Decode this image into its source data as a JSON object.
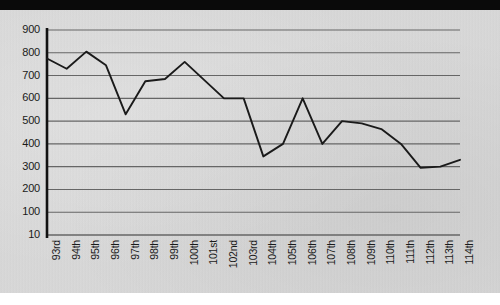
{
  "chart_data": {
    "type": "line",
    "title": "",
    "subtitle": "",
    "xlabel": "",
    "ylabel": "",
    "categories": [
      "93rd",
      "94th",
      "95th",
      "96th",
      "97th",
      "98th",
      "99th",
      "100th",
      "101st",
      "102nd",
      "103rd",
      "104th",
      "105th",
      "106th",
      "107th",
      "108th",
      "109th",
      "110th",
      "111th",
      "112th",
      "113th",
      "114th"
    ],
    "values": [
      775,
      730,
      805,
      745,
      530,
      675,
      685,
      760,
      680,
      600,
      600,
      345,
      400,
      600,
      400,
      500,
      490,
      465,
      400,
      295,
      300,
      330
    ],
    "series": [
      {
        "name": "",
        "values": [
          775,
          730,
          805,
          745,
          530,
          675,
          685,
          760,
          680,
          600,
          600,
          345,
          400,
          600,
          400,
          500,
          490,
          465,
          400,
          295,
          300,
          330
        ]
      }
    ],
    "ytick_labels": [
      "900",
      "800",
      "700",
      "600",
      "500",
      "400",
      "300",
      "200",
      "100",
      "10"
    ],
    "ytick_values": [
      900,
      800,
      700,
      600,
      500,
      400,
      300,
      200,
      100,
      10
    ],
    "ylim": [
      10,
      900
    ],
    "grid": true,
    "grid_axis": "y",
    "legend": false,
    "legend_position": "none",
    "line_color": "#1a1a1a",
    "grid_color": "#666666",
    "axis_color": "#111111",
    "background_color": "#d9d9d9",
    "annotations": []
  },
  "figure": {
    "top_band_color": "#0a0a0a",
    "bottom_band_color": "#ffffff"
  }
}
